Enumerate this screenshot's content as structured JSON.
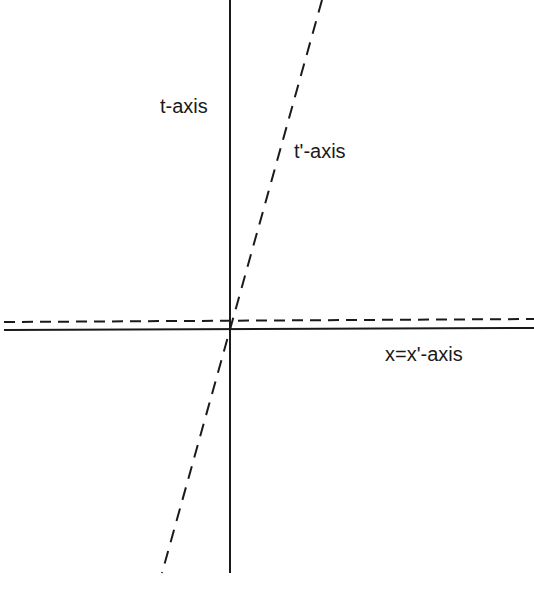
{
  "diagram": {
    "type": "spacetime-diagram",
    "colors": {
      "line": "#1a1a1a",
      "background": "#ffffff"
    },
    "lines": [
      {
        "id": "t-axis",
        "style": "solid",
        "x1": 230,
        "y1": 0,
        "x2": 230,
        "y2": 573
      },
      {
        "id": "x-axis",
        "style": "solid",
        "x1": 4,
        "y1": 330,
        "x2": 534,
        "y2": 328
      },
      {
        "id": "x-prime-axis",
        "style": "dashed",
        "x1": 4,
        "y1": 322,
        "x2": 534,
        "y2": 319
      },
      {
        "id": "t-prime-axis",
        "style": "dashed",
        "x1": 322,
        "y1": 0,
        "x2": 162,
        "y2": 573
      }
    ],
    "labels": {
      "t_axis": "t-axis",
      "t_prime_axis": "t'-axis",
      "x_axis": "x=x'-axis"
    }
  }
}
